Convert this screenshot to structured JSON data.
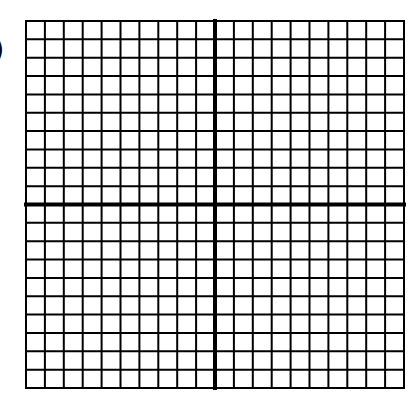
{
  "label": ")",
  "grid": {
    "left": 26,
    "top": 21,
    "right": 404,
    "bottom": 388,
    "cols": 20,
    "rows": 20,
    "axis_col": 10,
    "axis_row": 10,
    "line_color": "#000000",
    "line_width": 2,
    "axis_width": 4
  }
}
